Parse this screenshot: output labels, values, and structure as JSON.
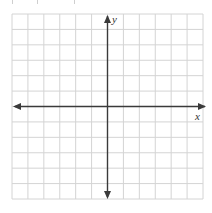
{
  "diagram": {
    "type": "coordinate-plane",
    "x_axis_label": "x",
    "y_axis_label": "y",
    "grid": {
      "columns": 12,
      "rows": 12,
      "origin_column": 6,
      "origin_row": 6,
      "line_color": "#d4d4d4",
      "axis_color": "#3a3a3a"
    }
  }
}
